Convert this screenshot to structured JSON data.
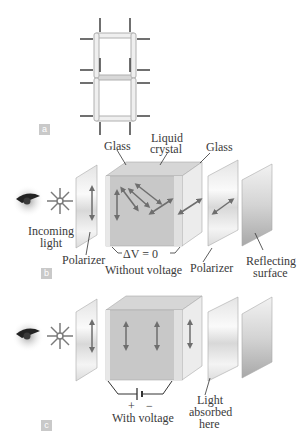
{
  "panels": {
    "a": {
      "tag": "a"
    },
    "b": {
      "tag": "b",
      "labels": {
        "glass_left": "Glass",
        "liquid_crystal_1": "Liquid",
        "liquid_crystal_2": "crystal",
        "glass_right": "Glass",
        "incoming_1": "Incoming",
        "incoming_2": "light",
        "polarizer_left": "Polarizer",
        "delta_v": "ΔV = 0",
        "without_voltage": "Without voltage",
        "polarizer_right": "Polarizer",
        "reflecting_1": "Reflecting",
        "reflecting_2": "surface"
      }
    },
    "c": {
      "tag": "c",
      "labels": {
        "plus": "+",
        "minus": "−",
        "with_voltage": "With voltage",
        "absorbed_1": "Light",
        "absorbed_2": "absorbed",
        "absorbed_3": "here"
      }
    }
  },
  "colors": {
    "cube_front": "#c8c8c8",
    "cube_side": "#e6e6e6",
    "cube_top": "#d6d6d6",
    "arrow": "#6e6e6e",
    "tag_bg": "#c9c9c9"
  }
}
